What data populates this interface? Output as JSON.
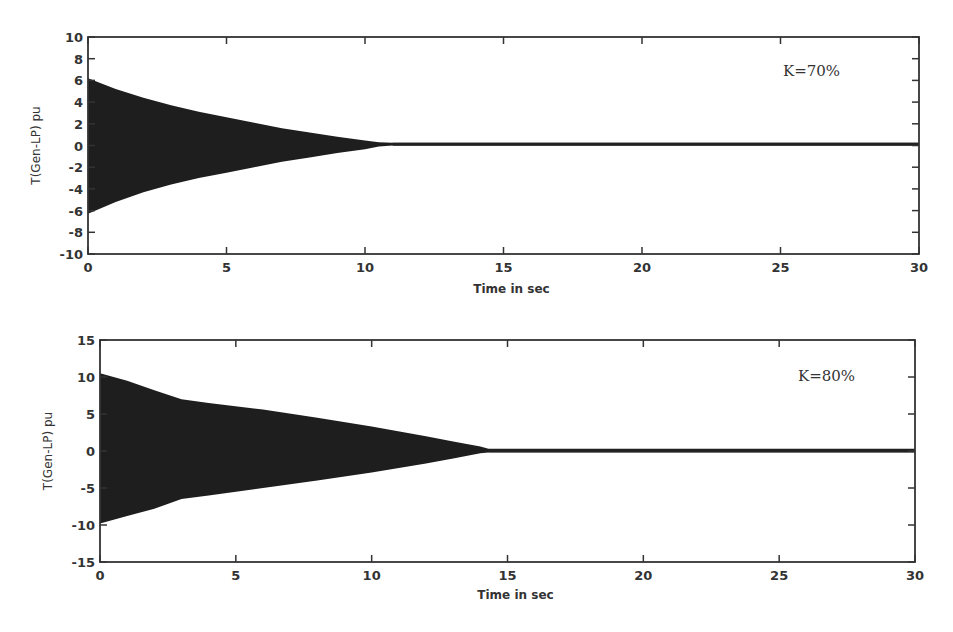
{
  "chart_data": [
    {
      "type": "area",
      "title": "",
      "annotation": "K=70%",
      "xlabel": "Time in sec",
      "ylabel": "T(Gen-LP) pu",
      "xlim": [
        0,
        30
      ],
      "ylim": [
        -10,
        10
      ],
      "xticks": [
        "0",
        "5",
        "10",
        "15",
        "20",
        "25",
        "30"
      ],
      "yticks": [
        "10",
        "8",
        "6",
        "4",
        "2",
        "0",
        "-2",
        "-4",
        "-6",
        "-8",
        "-10"
      ],
      "grid": false,
      "series": [
        {
          "name": "oscillation envelope (upper)",
          "x": [
            0,
            1,
            2,
            3,
            4,
            5,
            6,
            7,
            8,
            9,
            10,
            10.5,
            11,
            15,
            20,
            25,
            30
          ],
          "values": [
            6.2,
            5.2,
            4.4,
            3.7,
            3.1,
            2.6,
            2.1,
            1.6,
            1.2,
            0.8,
            0.45,
            0.3,
            0.25,
            0.25,
            0.25,
            0.25,
            0.25
          ]
        },
        {
          "name": "oscillation envelope (lower)",
          "x": [
            0,
            1,
            2,
            3,
            4,
            5,
            6,
            7,
            8,
            9,
            10,
            10.5,
            11,
            15,
            20,
            25,
            30
          ],
          "values": [
            -6.3,
            -5.2,
            -4.3,
            -3.6,
            -3.0,
            -2.5,
            -2.0,
            -1.5,
            -1.1,
            -0.7,
            -0.35,
            -0.1,
            0.0,
            0.0,
            0.0,
            0.0,
            0.0
          ]
        }
      ]
    },
    {
      "type": "area",
      "title": "",
      "annotation": "K=80%",
      "xlabel": "Time in sec",
      "ylabel": "T(Gen-LP) pu",
      "xlim": [
        0,
        30
      ],
      "ylim": [
        -15,
        15
      ],
      "xticks": [
        "0",
        "5",
        "10",
        "15",
        "20",
        "25",
        "30"
      ],
      "yticks": [
        "15",
        "10",
        "5",
        "0",
        "-5",
        "-10",
        "-15"
      ],
      "grid": false,
      "series": [
        {
          "name": "oscillation envelope (upper)",
          "x": [
            0,
            1,
            2,
            3,
            4,
            6,
            8,
            10,
            12,
            13,
            14,
            14.3,
            15,
            20,
            25,
            30
          ],
          "values": [
            10.5,
            9.5,
            8.2,
            7.0,
            6.5,
            5.6,
            4.5,
            3.3,
            2.0,
            1.3,
            0.6,
            0.3,
            0.3,
            0.3,
            0.3,
            0.3
          ]
        },
        {
          "name": "oscillation envelope (lower)",
          "x": [
            0,
            1,
            2,
            3,
            4,
            6,
            8,
            10,
            12,
            13,
            14,
            14.3,
            15,
            20,
            25,
            30
          ],
          "values": [
            -9.8,
            -8.8,
            -7.8,
            -6.5,
            -6.0,
            -5.0,
            -4.0,
            -2.9,
            -1.7,
            -1.0,
            -0.3,
            -0.2,
            -0.2,
            -0.2,
            -0.2,
            -0.2
          ]
        }
      ]
    }
  ]
}
